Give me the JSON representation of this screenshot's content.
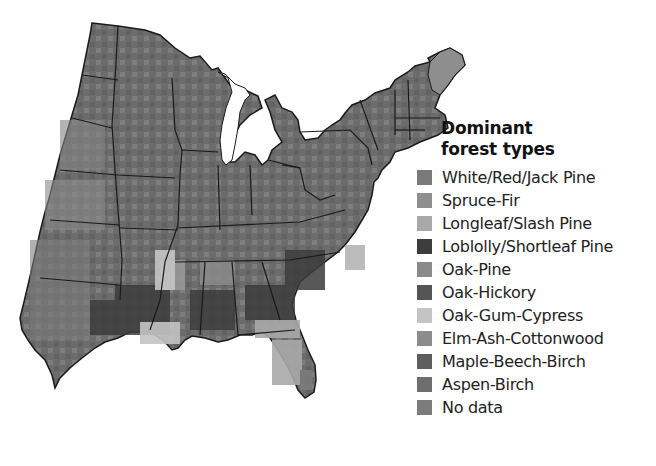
{
  "legend": {
    "title_line1": "Dominant",
    "title_line2": "forest types",
    "items": [
      {
        "label": "White/Red/Jack Pine",
        "color": "#7a7a7a"
      },
      {
        "label": "Spruce-Fir",
        "color": "#8e8e8e"
      },
      {
        "label": "Longleaf/Slash Pine",
        "color": "#a9a9a9"
      },
      {
        "label": "Loblolly/Shortleaf Pine",
        "color": "#3c3c3c"
      },
      {
        "label": "Oak-Pine",
        "color": "#8a8a8a"
      },
      {
        "label": "Oak-Hickory",
        "color": "#555555"
      },
      {
        "label": "Oak-Gum-Cypress",
        "color": "#c4c4c4"
      },
      {
        "label": "Elm-Ash-Cottonwood",
        "color": "#8c8c8c"
      },
      {
        "label": "Maple-Beech-Birch",
        "color": "#5e5e5e"
      },
      {
        "label": "Aspen-Birch",
        "color": "#6e6e6e"
      },
      {
        "label": "No data",
        "color": "#7c7c7c"
      }
    ]
  },
  "map": {
    "region": "Eastern United States",
    "land_color": "#6f6f6f",
    "border_color": "#1a1a1a",
    "water_color": "#ffffff"
  }
}
